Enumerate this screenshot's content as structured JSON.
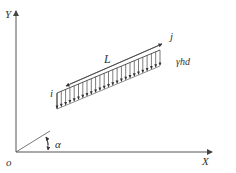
{
  "diagram": {
    "type": "coordinate system with inclined distributed load",
    "axes": {
      "x_label": "X",
      "y_label": "Y",
      "origin_label": "o"
    },
    "angle_label": "α",
    "member": {
      "start_node": "i",
      "end_node": "j",
      "length_label": "L",
      "load_label": "γhd"
    },
    "colors": {
      "line": "#444444",
      "background": "#ffffff"
    }
  }
}
